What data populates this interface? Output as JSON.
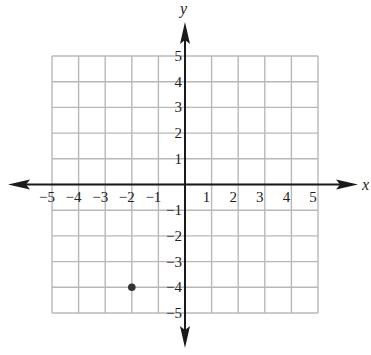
{
  "chart_data": {
    "type": "scatter",
    "title": "",
    "xlabel": "x",
    "ylabel": "y",
    "xlim": [
      -5,
      5
    ],
    "ylim": [
      -5,
      5
    ],
    "grid": true,
    "x_ticks": [
      -5,
      -4,
      -3,
      -2,
      -1,
      1,
      2,
      3,
      4,
      5
    ],
    "y_ticks": [
      -5,
      -4,
      -3,
      -2,
      -1,
      1,
      2,
      3,
      4,
      5
    ],
    "x_tick_labels": [
      "−5",
      "−4",
      "−3",
      "−2",
      "−1",
      "1",
      "2",
      "3",
      "4",
      "5"
    ],
    "y_tick_labels": [
      "−5",
      "−4",
      "−3",
      "−2",
      "−1",
      "1",
      "2",
      "3",
      "4",
      "5"
    ],
    "points": [
      {
        "x": -2,
        "y": -4
      }
    ],
    "axes_arrows": true,
    "legend": null
  },
  "colors": {
    "grid": "#b8b8b8",
    "axis": "#1a1a1a",
    "point": "#333333"
  }
}
